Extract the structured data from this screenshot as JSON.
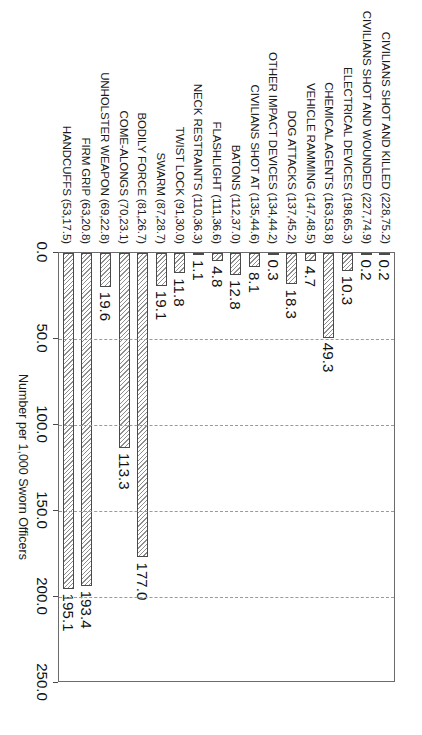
{
  "chart_data": {
    "type": "bar",
    "orientation": "horizontal",
    "title": "",
    "subtitle": "",
    "xlabel": "Number per 1,000 Sworn Officers",
    "ylabel": "",
    "xlim": [
      0.0,
      250.0
    ],
    "xticks": [
      "0.0",
      "50.0",
      "100.0",
      "150.0",
      "200.0",
      "250.0"
    ],
    "xtick_values": [
      0,
      50,
      100,
      150,
      200,
      250
    ],
    "grid": true,
    "grid_axis": "x",
    "legend": false,
    "categories": [
      "CIVILIANS SHOT AND KILLED (228,75.2)",
      "CIVILIANS SHOT AND WOUNDED (227,74.9)",
      "ELECTRICAL DEVICES (198,65.3)",
      "CHEMICAL AGENTS (163,53.8)",
      "VEHICLE RAMMING (147,48.5)",
      "DOG ATTACKS (137,45.2)",
      "OTHER IMPACT DEVICES (134,44.2)",
      "CIVILIANS SHOT AT (135,44.6)",
      "BATONS (112,37.0)",
      "FLASHLIGHT (111,36.6)",
      "NECK RESTRAINTS (110,36.3)",
      "TWIST LOCK (91,30.0)",
      "SWARM (87,28.7)",
      "BODILY FORCE (81,26.7)",
      "COME-ALONGS (70,23.1)",
      "UNHOLSTER WEAPON (69,22.8)",
      "FIRM GRIP (63,20.8)",
      "HANDCUFFS (53,17.5)"
    ],
    "values": [
      0.2,
      0.2,
      10.3,
      49.3,
      4.7,
      18.3,
      0.3,
      8.1,
      12.8,
      4.8,
      1.1,
      11.8,
      19.1,
      177.0,
      113.3,
      19.6,
      193.4,
      195.1
    ],
    "value_labels": [
      "0.2",
      "0.2",
      "10.3",
      "49.3",
      "4.7",
      "18.3",
      "0.3",
      "8.1",
      "12.8",
      "4.8",
      "1.1",
      "11.8",
      "19.1",
      "177.0",
      "113.3",
      "19.6",
      "193.4",
      "195.1"
    ],
    "colors": {
      "bar_fill": "#ffffff",
      "bar_hatch": "#8e8e8e",
      "bar_edge": "#4a4a4a",
      "grid": "#9a9a9a",
      "frame": "#6b6b6b",
      "text": "#1a1a1a"
    }
  }
}
